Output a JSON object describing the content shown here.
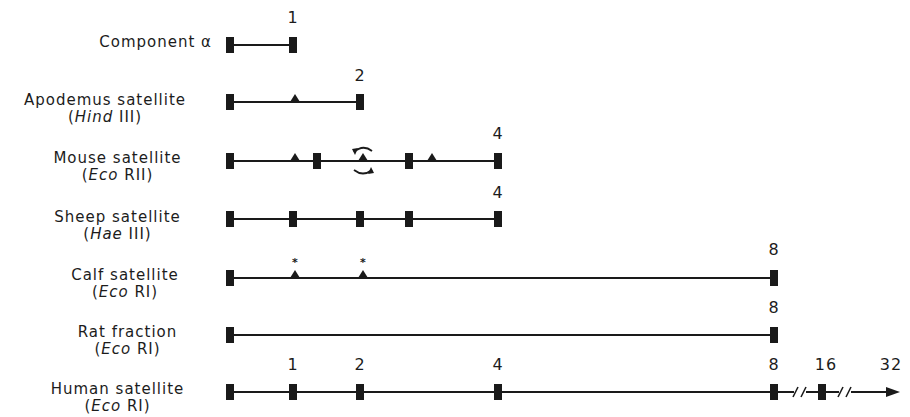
{
  "figure": {
    "unit_positions_px": {
      "0": 230,
      "1": 293,
      "2": 360,
      "4": 498,
      "8": 774,
      "16": 822,
      "32": 900
    },
    "rows": [
      {
        "name": "Component α",
        "enzyme": "",
        "enzyme_italic": "",
        "enzyme_roman": "",
        "y": 45,
        "length_label": "1",
        "length_x": 293,
        "sites": [
          230,
          293
        ],
        "triangles": [],
        "starred": [],
        "rotating": []
      },
      {
        "name": "Apodemus satellite",
        "enzyme": "(Hind III)",
        "enzyme_italic": "Hind",
        "enzyme_roman": " III)",
        "y": 102,
        "length_label": "2",
        "length_x": 360,
        "sites": [
          230,
          360
        ],
        "triangles": [
          295
        ],
        "starred": [],
        "rotating": []
      },
      {
        "name": "Mouse satellite",
        "enzyme": "(Eco RII)",
        "enzyme_italic": "Eco",
        "enzyme_roman": " RII)",
        "y": 161,
        "length_label": "4",
        "length_x": 498,
        "sites": [
          230,
          317,
          409,
          498
        ],
        "triangles": [
          295,
          432
        ],
        "starred": [],
        "rotating": [
          363
        ]
      },
      {
        "name": "Sheep satellite",
        "enzyme": "(Hae III)",
        "enzyme_italic": "Hae",
        "enzyme_roman": " III)",
        "y": 219,
        "length_label": "4",
        "length_x": 498,
        "sites": [
          230,
          293,
          360,
          409,
          498
        ],
        "triangles": [],
        "starred": [],
        "rotating": []
      },
      {
        "name": "Calf satellite",
        "enzyme": "(Eco RI)",
        "enzyme_italic": "Eco",
        "enzyme_roman": " RI)",
        "y": 278,
        "length_label": "8",
        "length_x": 774,
        "sites": [
          230,
          774
        ],
        "triangles": [],
        "starred": [
          295,
          363
        ],
        "rotating": []
      },
      {
        "name": "Rat fraction",
        "enzyme": "(Eco RI)",
        "enzyme_italic": "Eco",
        "enzyme_roman": " RI)",
        "y": 335,
        "length_label": "8",
        "length_x": 774,
        "sites": [
          230,
          774
        ],
        "triangles": [],
        "starred": [],
        "rotating": []
      },
      {
        "name": "Human satellite",
        "enzyme": "(Eco RI)",
        "enzyme_italic": "Eco",
        "enzyme_roman": " RI)",
        "y": 392,
        "length_label": "",
        "length_x": 0,
        "sites": [
          230,
          293,
          360,
          498,
          774,
          822
        ],
        "triangles": [],
        "starred": [],
        "rotating": [],
        "scale_labels": [
          {
            "text": "1",
            "x": 293
          },
          {
            "text": "2",
            "x": 360
          },
          {
            "text": "4",
            "x": 498
          },
          {
            "text": "8",
            "x": 774
          },
          {
            "text": "16",
            "x": 822
          },
          {
            "text": "32",
            "x": 893
          }
        ],
        "breaks": [
          800,
          845
        ],
        "arrow_end": 900
      }
    ],
    "labels": {
      "row0_name": "Component α",
      "row1_name": "Apodemus satellite",
      "row1_enz_open": "(",
      "row1_enz_it": "Hind",
      "row1_enz_rest": " III)",
      "row2_name": "Mouse satellite",
      "row2_enz_open": "(",
      "row2_enz_it": "Eco",
      "row2_enz_rest": " RII)",
      "row3_name": "Sheep satellite",
      "row3_enz_open": "(",
      "row3_enz_it": "Hae",
      "row3_enz_rest": " III)",
      "row4_name": "Calf satellite",
      "row4_enz_open": "(",
      "row4_enz_it": "Eco",
      "row4_enz_rest": " RI)",
      "row5_name": "Rat fraction",
      "row5_enz_open": "(",
      "row5_enz_it": "Eco",
      "row5_enz_rest": " RI)",
      "row6_name": "Human satellite",
      "row6_enz_open": "(",
      "row6_enz_it": "Eco",
      "row6_enz_rest": " RI)"
    },
    "numbers": {
      "row0_len": "1",
      "row1_len": "2",
      "row2_len": "4",
      "row3_len": "4",
      "row4_len": "8",
      "row5_len": "8",
      "h1": "1",
      "h2": "2",
      "h4": "4",
      "h8": "8",
      "h16": "16",
      "h32": "32"
    },
    "colors": {
      "ink": "#1a1a1a",
      "background": "#ffffff"
    }
  }
}
